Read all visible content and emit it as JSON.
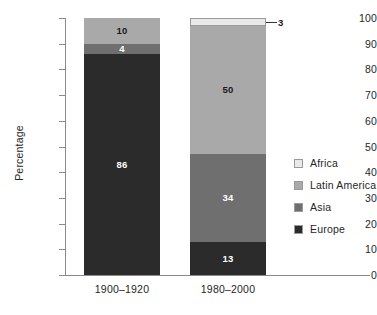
{
  "chart_data": {
    "type": "bar",
    "subtype": "stacked-column-100",
    "title": "",
    "xlabel": "",
    "ylabel": "Percentage",
    "ylim": [
      0,
      100
    ],
    "ytick_step": 10,
    "ytick_labels": [
      "100",
      "90",
      "80",
      "70",
      "60",
      "50",
      "40",
      "30",
      "20",
      "10",
      "0"
    ],
    "grid": false,
    "legend_position": "right",
    "categories": [
      "1900–1920",
      "1980–2000"
    ],
    "series": [
      {
        "name": "Africa",
        "color": "#e9e9e9",
        "label_color": "#1a1a1a",
        "values": [
          0,
          3
        ],
        "value_labels": [
          "",
          "3"
        ]
      },
      {
        "name": "Latin America",
        "color": "#a9a9a9",
        "label_color": "#1a1a1a",
        "values": [
          10,
          50
        ],
        "value_labels": [
          "10",
          "50"
        ]
      },
      {
        "name": "Asia",
        "color": "#6f6f6f",
        "label_color": "#ffffff",
        "values": [
          4,
          34
        ],
        "value_labels": [
          "4",
          "34"
        ]
      },
      {
        "name": "Europe",
        "color": "#2b2b2b",
        "label_color": "#ffffff",
        "values": [
          86,
          13
        ],
        "value_labels": [
          "86",
          "13"
        ]
      }
    ],
    "callouts": [
      {
        "text": "3",
        "series": "Africa",
        "category": "1980–2000"
      }
    ]
  },
  "axis": {
    "y_title": "Percentage",
    "ticks": [
      "100",
      "90",
      "80",
      "70",
      "60",
      "50",
      "40",
      "30",
      "20",
      "10",
      "0"
    ]
  },
  "legend": {
    "items": [
      {
        "label": "Africa",
        "color": "#e9e9e9"
      },
      {
        "label": "Latin America",
        "color": "#a9a9a9"
      },
      {
        "label": "Asia",
        "color": "#6f6f6f"
      },
      {
        "label": "Europe",
        "color": "#2b2b2b"
      }
    ]
  },
  "x_labels": [
    "1900–1920",
    "1980–2000"
  ],
  "bar1": {
    "latin_america": "10",
    "asia": "4",
    "europe": "86"
  },
  "bar2": {
    "africa": "3",
    "latin_america": "50",
    "asia": "34",
    "europe": "13"
  }
}
